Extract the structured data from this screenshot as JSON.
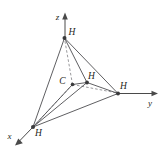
{
  "figure": {
    "background_color": "#ffffff",
    "line_color": "#4d4d50",
    "dashed_color": "#86868a",
    "label_color": "#1f1f22"
  },
  "axes": [
    {
      "name": "z-axis",
      "label": "z",
      "label_x": 57.5,
      "label_y": 17.5,
      "start_x": 65.0,
      "start_y": 38.0,
      "end_x": 65.0,
      "end_y": 15.0,
      "arrow": "up",
      "arrow_points": "65,12.5 62.2,19.5 67.8,19.5"
    },
    {
      "name": "y-axis",
      "label": "y",
      "label_x": 150.0,
      "label_y": 104.0,
      "start_x": 118.0,
      "start_y": 93.5,
      "end_x": 155.0,
      "end_y": 93.5,
      "arrow": "right",
      "arrow_points": "158.0,93.5 151.5,90.8 151.5,96.2"
    },
    {
      "name": "x-axis",
      "label": "x",
      "label_x": 9.5,
      "label_y": 137.0,
      "start_x": 33.0,
      "start_y": 127.0,
      "end_x": 18.5,
      "end_y": 142.0,
      "arrow": "down-left",
      "arrow_points": "15.0,145.5 22.8,143.2 18.3,138.6"
    }
  ],
  "atoms": [
    {
      "name": "hydrogen-top",
      "element": "H",
      "x": 64.5,
      "y": 38.0,
      "label_x": 72.0,
      "label_y": 32.5,
      "dot_r": 2.0
    },
    {
      "name": "hydrogen-right",
      "element": "H",
      "x": 118.0,
      "y": 93.5,
      "label_x": 123.5,
      "label_y": 86.5,
      "dot_r": 2.0
    },
    {
      "name": "hydrogen-front-left",
      "element": "H",
      "x": 33.0,
      "y": 127.0,
      "label_x": 38.5,
      "label_y": 133.5,
      "dot_r": 2.0
    },
    {
      "name": "hydrogen-middle",
      "element": "H",
      "x": 87.0,
      "y": 82.5,
      "label_x": 91.5,
      "label_y": 77.0,
      "dot_r": 1.9
    },
    {
      "name": "carbon-center",
      "element": "C",
      "x": 72.5,
      "y": 84.5,
      "label_x": 62.5,
      "label_y": 82.0,
      "dot_r": 1.8
    }
  ],
  "edges_solid": [
    {
      "name": "edge-top-to-right",
      "x1": 64.5,
      "y1": 38.0,
      "x2": 118.0,
      "y2": 93.5
    },
    {
      "name": "edge-top-to-frontleft",
      "x1": 64.5,
      "y1": 38.0,
      "x2": 33.0,
      "y2": 127.0
    },
    {
      "name": "edge-top-to-middle",
      "x1": 64.5,
      "y1": 38.0,
      "x2": 87.0,
      "y2": 82.5
    },
    {
      "name": "edge-right-to-frontleft",
      "x1": 118.0,
      "y1": 93.5,
      "x2": 33.0,
      "y2": 127.0
    },
    {
      "name": "edge-middle-to-right",
      "x1": 87.0,
      "y1": 82.5,
      "x2": 118.0,
      "y2": 93.5
    },
    {
      "name": "edge-middle-to-frontleft",
      "x1": 87.0,
      "y1": 82.5,
      "x2": 33.0,
      "y2": 127.0
    },
    {
      "name": "edge-center-to-middle",
      "x1": 72.5,
      "y1": 84.5,
      "x2": 87.0,
      "y2": 82.5
    },
    {
      "name": "edge-center-to-frontleft",
      "x1": 72.5,
      "y1": 84.5,
      "x2": 33.0,
      "y2": 127.0
    }
  ],
  "edges_dashed": [
    {
      "name": "bond-center-to-top",
      "x1": 72.5,
      "y1": 84.5,
      "x2": 64.5,
      "y2": 38.5
    },
    {
      "name": "bond-center-to-right",
      "x1": 72.5,
      "y1": 84.5,
      "x2": 117.5,
      "y2": 93.0
    },
    {
      "name": "bond-center-to-frontleft",
      "x1": 72.5,
      "y1": 84.5,
      "x2": 33.5,
      "y2": 126.5
    }
  ]
}
